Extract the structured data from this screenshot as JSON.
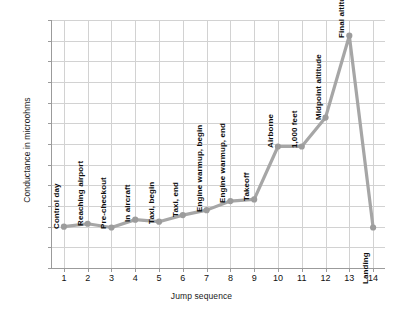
{
  "chart_data": {
    "type": "line",
    "title": "",
    "xlabel": "Jump sequence",
    "ylabel": "Conductance in microohms",
    "xlim": [
      0.5,
      14.5
    ],
    "ylim": [
      0,
      60
    ],
    "ytick_step": 5,
    "grid": true,
    "legend": "none",
    "series_color": "#a6a6a6",
    "marker_color": "#9c9c9c",
    "x": [
      1,
      2,
      3,
      4,
      5,
      6,
      7,
      8,
      9,
      10,
      11,
      12,
      13,
      14
    ],
    "xticks": [
      "1",
      "2",
      "3",
      "4",
      "5",
      "6",
      "7",
      "8",
      "9",
      "10",
      "11",
      "12",
      "13",
      "14"
    ],
    "yticks": [
      "0",
      "5",
      "10",
      "15",
      "20",
      "25",
      "30",
      "35",
      "40",
      "45",
      "50",
      "55",
      "60"
    ],
    "values": [
      10.0,
      10.7,
      9.8,
      11.7,
      11.2,
      12.8,
      14.0,
      16.2,
      16.6,
      29.4,
      29.4,
      36.4,
      56.2,
      9.8
    ],
    "point_labels": [
      "Control day",
      "Reaching airport",
      "Pre-checkout",
      "In aircraft",
      "Taxi, begin",
      "Taxi, end",
      "Engine warmup, begin",
      "Engine warmup, end",
      "Takeoff",
      "Airborne",
      "1,000 feet",
      "Midpoint altitude",
      "Final altitude",
      "Landing"
    ]
  }
}
